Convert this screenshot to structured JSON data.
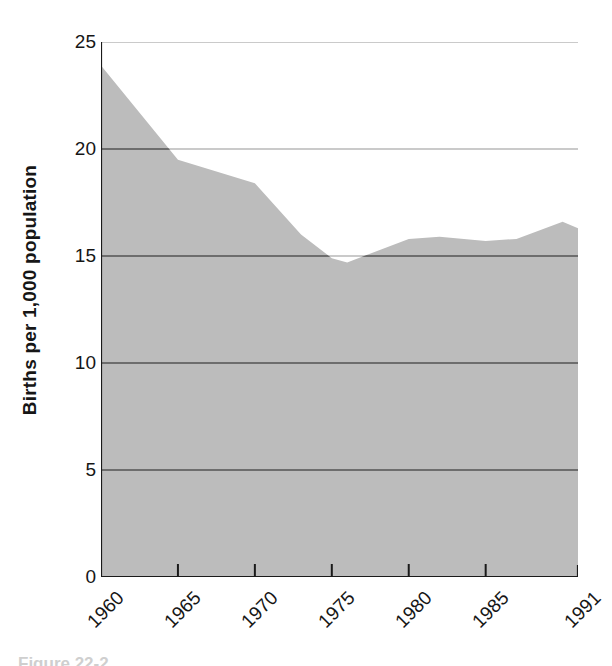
{
  "chart_data": {
    "type": "area",
    "title": "",
    "xlabel": "",
    "ylabel": "Births per 1,000 population",
    "xlim": [
      1960,
      1991
    ],
    "ylim": [
      0,
      25
    ],
    "grid": true,
    "legend": false,
    "x_tick_labels": [
      "1960",
      "1965",
      "1970",
      "1975",
      "1980",
      "1985",
      "1991"
    ],
    "x_tick_values": [
      1960,
      1965,
      1970,
      1975,
      1980,
      1985,
      1991
    ],
    "y_tick_labels": [
      "0",
      "5",
      "10",
      "15",
      "20",
      "25"
    ],
    "y_tick_values": [
      0,
      5,
      10,
      15,
      20,
      25
    ],
    "x": [
      1960,
      1965,
      1970,
      1973,
      1975,
      1976,
      1980,
      1982,
      1985,
      1987,
      1990,
      1991
    ],
    "values": [
      23.9,
      19.5,
      18.4,
      16.0,
      14.9,
      14.7,
      15.8,
      15.9,
      15.7,
      15.8,
      16.6,
      16.3
    ],
    "series": [
      {
        "name": "Birth rate",
        "values": [
          23.9,
          19.5,
          18.4,
          16.0,
          14.9,
          14.7,
          15.8,
          15.9,
          15.7,
          15.8,
          16.6,
          16.3
        ]
      }
    ],
    "fill_color": "#bcbcbc",
    "gridline_color": "#6d6d6d",
    "gridline_color_light": "#b9b9b9",
    "axis_color": "#1a1a1a"
  },
  "caption": {
    "text": "Figure 22-2"
  }
}
